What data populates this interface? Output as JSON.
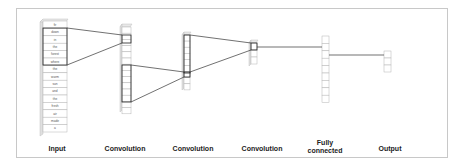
{
  "diagram": {
    "input_words": [
      "fir",
      "down",
      "in",
      "the",
      "forest",
      "where",
      "the",
      "warm",
      "sun",
      "and",
      "the",
      "fresh",
      "air",
      "made",
      "a"
    ],
    "layers": [
      {
        "label": "Input"
      },
      {
        "label": "Convolution"
      },
      {
        "label": "Convolution"
      },
      {
        "label": "Convolution"
      },
      {
        "label": "Fully connected",
        "line1": "Fully",
        "line2": "connected"
      },
      {
        "label": "Output"
      }
    ],
    "colors": {
      "border": "#c8c8c8",
      "cell_stroke": "#b0b0b0",
      "highlight_stroke": "#222222",
      "line": "#333333"
    }
  }
}
